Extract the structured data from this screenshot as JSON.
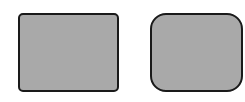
{
  "shapes": [
    {
      "name": "rounded-rectangle-small-radius",
      "fill": "#a9a9a9",
      "stroke": "#1a1a1a",
      "corner_radius": "small"
    },
    {
      "name": "rounded-rectangle-large-radius",
      "fill": "#a9a9a9",
      "stroke": "#1a1a1a",
      "corner_radius": "large"
    }
  ]
}
